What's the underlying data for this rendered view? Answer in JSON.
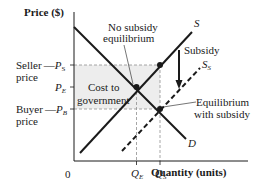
{
  "diagram": {
    "y_axis_label": "Price ($)",
    "x_axis_label": "Quantity (units)",
    "origin_label": "0",
    "curves": {
      "demand": "D",
      "supply": "S",
      "supply_with_subsidy": "S",
      "supply_with_subsidy_sub": "S"
    },
    "price_labels": {
      "seller_text": "Seller",
      "seller_text2": "price",
      "seller_dash": "—",
      "p_s": "P",
      "p_s_sub": "S",
      "p_e": "P",
      "p_e_sub": "E",
      "buyer_text": "Buyer",
      "buyer_text2": "price",
      "buyer_dash": "—",
      "p_b": "P",
      "p_b_sub": "B"
    },
    "quantity_labels": {
      "q_e": "Q",
      "q_e_sub": "E",
      "q_s": "Q",
      "q_s_sub": "S"
    },
    "annotations": {
      "no_subsidy_line1": "No subsidy",
      "no_subsidy_line2": "equilibrium",
      "subsidy": "Subsidy",
      "cost_line1": "Cost to",
      "cost_line2": "government",
      "eq_subsidy_line1": "Equilibrium",
      "eq_subsidy_line2": "with subsidy"
    },
    "colors": {
      "ink": "#1a1a1a",
      "guide": "#9a9a9a",
      "shade": "#ececec"
    }
  }
}
